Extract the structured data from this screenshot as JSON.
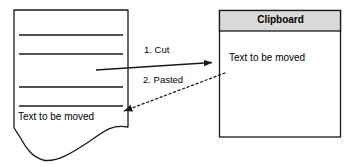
{
  "diagram": {
    "colors": {
      "stroke": "#1a1a1a",
      "header_fill": "#d9d9d9",
      "box_fill": "#ffffff",
      "text": "#000000"
    },
    "document": {
      "name": "document-page",
      "text": "Text to be moved",
      "rule_count": 4
    },
    "clipboard": {
      "name": "clipboard-panel",
      "title": "Clipboard",
      "text": "Text to be moved"
    },
    "arrows": [
      {
        "name": "cut-arrow",
        "label": "1. Cut",
        "style": "solid",
        "direction": "document-to-clipboard"
      },
      {
        "name": "paste-arrow",
        "label": "2. Pasted",
        "style": "dashed",
        "direction": "clipboard-to-document"
      }
    ]
  }
}
